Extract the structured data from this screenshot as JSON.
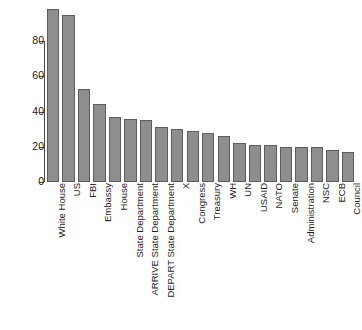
{
  "chart_data": {
    "type": "bar",
    "title": "",
    "subtitle": "",
    "xlabel": "",
    "ylabel": "",
    "grid": false,
    "legend": "none",
    "ylim": [
      0,
      100
    ],
    "yticks": [
      0,
      20,
      40,
      60,
      80
    ],
    "ytick_labels": [
      "0",
      "20",
      "40",
      "60",
      "80"
    ],
    "orientation": "vertical",
    "bar_color": "#8e8e8e",
    "bar_edge_color": "#5d5d5d",
    "axis_color": "#4a4a4a",
    "background_color": "#ffffff",
    "categories": [
      "White House",
      "US",
      "FBI",
      "Embassy",
      "House",
      "State Department",
      "ARRIVE State Department",
      "DEPART State Department",
      "X",
      "Congress",
      "Treasury",
      "WH",
      "UN",
      "USAID",
      "NATO",
      "Senate",
      "Administration",
      "NSC",
      "ECB",
      "Council"
    ],
    "values": [
      98,
      95,
      53,
      44,
      37,
      36,
      35,
      31,
      30,
      29,
      28,
      26,
      22,
      21,
      21,
      20,
      20,
      20,
      18,
      17
    ]
  }
}
